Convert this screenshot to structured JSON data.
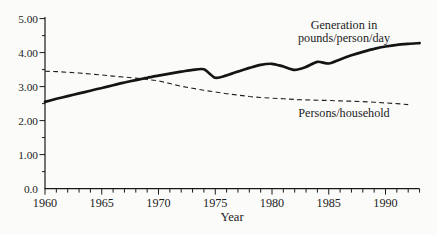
{
  "page": {
    "background": "#fbfbf9",
    "ink": "#1c1c1c"
  },
  "chart_data": {
    "type": "line",
    "title": "",
    "xlabel": "Year",
    "ylabel": "",
    "xlim": [
      1960,
      1993
    ],
    "ylim": [
      0,
      5
    ],
    "grid": false,
    "legend": "inline-annotations",
    "x_major_ticks": [
      1960,
      1965,
      1970,
      1975,
      1980,
      1985,
      1990
    ],
    "x_tick_labels": [
      "1960",
      "1965",
      "1970",
      "1975",
      "1980",
      "1985",
      "1990"
    ],
    "x_minor_tick_step": 1,
    "y_major_ticks": [
      0,
      1,
      2,
      3,
      4,
      5
    ],
    "y_tick_labels": [
      "0.0",
      "1.00",
      "2.00",
      "3.00",
      "4.00",
      "5.00"
    ],
    "y_minor_tick_step": 0.5,
    "series": [
      {
        "name": "Generation in pounds/person/day",
        "line_style": "solid",
        "x": [
          1960,
          1961,
          1962,
          1963,
          1964,
          1965,
          1966,
          1967,
          1968,
          1969,
          1970,
          1971,
          1972,
          1973,
          1974,
          1975,
          1976,
          1977,
          1978,
          1979,
          1980,
          1981,
          1982,
          1983,
          1984,
          1985,
          1986,
          1987,
          1988,
          1989,
          1990,
          1991,
          1992,
          1993
        ],
        "y": [
          2.55,
          2.64,
          2.72,
          2.8,
          2.88,
          2.96,
          3.04,
          3.12,
          3.19,
          3.26,
          3.32,
          3.38,
          3.44,
          3.49,
          3.51,
          3.26,
          3.33,
          3.44,
          3.55,
          3.64,
          3.67,
          3.59,
          3.49,
          3.58,
          3.73,
          3.68,
          3.8,
          3.92,
          4.02,
          4.11,
          4.18,
          4.23,
          4.26,
          4.28
        ]
      },
      {
        "name": "Persons/household",
        "line_style": "dashed",
        "x": [
          1960,
          1961,
          1962,
          1963,
          1964,
          1965,
          1966,
          1967,
          1968,
          1969,
          1970,
          1971,
          1972,
          1973,
          1974,
          1975,
          1976,
          1977,
          1978,
          1979,
          1980,
          1981,
          1982,
          1983,
          1984,
          1985,
          1986,
          1987,
          1988,
          1989,
          1990,
          1991,
          1992
        ],
        "y": [
          3.45,
          3.44,
          3.42,
          3.4,
          3.37,
          3.34,
          3.31,
          3.28,
          3.25,
          3.21,
          3.17,
          3.09,
          3.01,
          2.95,
          2.89,
          2.84,
          2.79,
          2.75,
          2.71,
          2.68,
          2.66,
          2.64,
          2.62,
          2.61,
          2.6,
          2.59,
          2.58,
          2.57,
          2.56,
          2.54,
          2.52,
          2.5,
          2.47
        ]
      }
    ],
    "annotations": [
      {
        "lines": [
          "Generation in",
          "pounds/person/day"
        ],
        "px": 344,
        "py": 29,
        "line_height": 12.5
      },
      {
        "lines": [
          "Persons/household"
        ],
        "px": 344,
        "py": 116.5,
        "line_height": 12.5
      }
    ]
  }
}
